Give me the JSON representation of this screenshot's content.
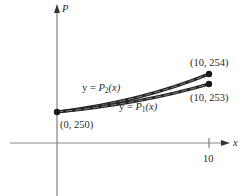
{
  "diagram": {
    "title": "",
    "axes": {
      "y_label": "P",
      "x_label": "x",
      "x_ticks": [
        {
          "value": 10,
          "label": "10"
        }
      ]
    },
    "points": [
      {
        "id": "start",
        "label": "(0, 250)",
        "x": 0,
        "y": 250
      },
      {
        "id": "p2_end",
        "label": "(10, 254)",
        "x": 10,
        "y": 254
      },
      {
        "id": "p1_end",
        "label": "(10, 253)",
        "x": 10,
        "y": 253
      }
    ],
    "curves": [
      {
        "id": "P2",
        "label_prefix": "y = ",
        "label_func": "P",
        "label_sub": "2",
        "label_arg": "(x)",
        "from": "(0, 250)",
        "to": "(10, 254)"
      },
      {
        "id": "P1",
        "label_prefix": "y = ",
        "label_func": "P",
        "label_sub": "1",
        "label_arg": "(x)",
        "from": "(0, 250)",
        "to": "(10, 253)"
      }
    ],
    "colors": {
      "axis": "#555555",
      "curve": "#222222",
      "curve_highlight": "#9a9a9a",
      "text": "#2a2a2a"
    }
  }
}
